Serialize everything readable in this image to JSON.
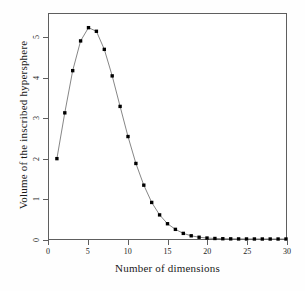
{
  "chart_data": {
    "type": "line",
    "title": "",
    "xlabel": "Number of dimensions",
    "ylabel": "Volume of the inscribed hypersphere",
    "xlim": [
      0,
      30
    ],
    "ylim": [
      0,
      5.6
    ],
    "xticks": [
      0,
      5,
      10,
      15,
      20,
      25,
      30
    ],
    "yticks": [
      0,
      1,
      2,
      3,
      4,
      5
    ],
    "grid": false,
    "legend": null,
    "marker": "filled-square",
    "marker_color": "#000000",
    "line_color": "#777777",
    "x": [
      1,
      2,
      3,
      4,
      5,
      6,
      7,
      8,
      9,
      10,
      11,
      12,
      13,
      14,
      15,
      16,
      17,
      18,
      19,
      20,
      21,
      22,
      23,
      24,
      25,
      26,
      27,
      28,
      29,
      30
    ],
    "values": [
      2.0,
      3.14,
      4.19,
      4.93,
      5.26,
      5.17,
      4.72,
      4.06,
      3.3,
      2.55,
      1.88,
      1.34,
      0.91,
      0.6,
      0.38,
      0.24,
      0.14,
      0.08,
      0.044,
      0.024,
      0.013,
      0.007,
      0.0037,
      0.0019,
      0.00096,
      0.00047,
      0.00023,
      0.00011,
      5e-05,
      2e-05
    ],
    "series": [
      {
        "name": "Volume of the inscribed hypersphere",
        "values": [
          2.0,
          3.14,
          4.19,
          4.93,
          5.26,
          5.17,
          4.72,
          4.06,
          3.3,
          2.55,
          1.88,
          1.34,
          0.91,
          0.6,
          0.38,
          0.24,
          0.14,
          0.08,
          0.044,
          0.024,
          0.013,
          0.007,
          0.0037,
          0.0019,
          0.00096,
          0.00047,
          0.00023,
          0.00011,
          5e-05,
          2e-05
        ]
      }
    ]
  }
}
